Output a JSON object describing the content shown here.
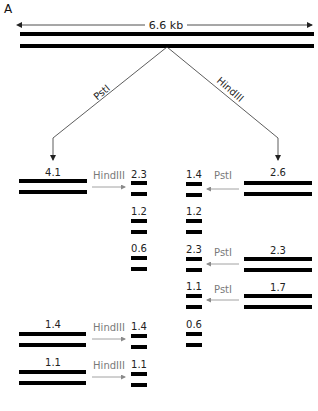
{
  "panel_label": "A",
  "plasmid": {
    "size_label": "6.6 kb",
    "bar_color": "#000000"
  },
  "branches": {
    "left_enzyme": "PstI",
    "right_enzyme": "HindIII"
  },
  "colors": {
    "line": "#333333",
    "secondary_arrow": "#8a8a8a",
    "secondary_text": "#7a7a7a",
    "text": "#222222"
  },
  "left_digest": {
    "fragments": [
      {
        "size": "4.1",
        "enzyme": "HindIII",
        "products": [
          "2.3",
          "1.2",
          "0.6"
        ]
      },
      {
        "size": "1.4",
        "enzyme": "HindIII",
        "products": [
          "1.4"
        ]
      },
      {
        "size": "1.1",
        "enzyme": "HindIII",
        "products": [
          "1.1"
        ]
      }
    ]
  },
  "right_digest": {
    "fragments": [
      {
        "size": "2.6",
        "enzyme": "PstI",
        "products": [
          "1.4",
          "1.2"
        ]
      },
      {
        "size": "2.3",
        "enzyme": "PstI",
        "products": [
          "2.3"
        ]
      },
      {
        "size": "1.7",
        "enzyme": "PstI",
        "products": [
          "1.1",
          "0.6"
        ]
      }
    ]
  },
  "labels": {
    "l_4_1": "4.1",
    "l_hind_1": "HindIII",
    "l_p_2_3": "2.3",
    "l_p_1_2": "1.2",
    "l_p_0_6": "0.6",
    "l_1_4": "1.4",
    "l_hind_2": "HindIII",
    "l_p_1_4": "1.4",
    "l_1_1": "1.1",
    "l_hind_3": "HindIII",
    "l_p_1_1": "1.1",
    "r_2_6": "2.6",
    "r_pst_1": "PstI",
    "r_p_1_4": "1.4",
    "r_p_1_2": "1.2",
    "r_2_3": "2.3",
    "r_pst_2": "PstI",
    "r_p_2_3": "2.3",
    "r_1_7": "1.7",
    "r_pst_3": "PstI",
    "r_p_1_1": "1.1",
    "r_p_0_6": "0.6"
  }
}
